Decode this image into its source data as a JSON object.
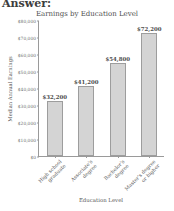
{
  "header": {
    "answer_label": "Answer:"
  },
  "chart_data": {
    "type": "bar",
    "title": "Earnings by Education Level",
    "xlabel": "Education Level",
    "ylabel": "Median Annual Earnings",
    "categories": [
      "High school graduate",
      "Associate's degree",
      "Bachelor's degree",
      "Master's degree or higher"
    ],
    "category_lines": [
      [
        "High school",
        "graduate"
      ],
      [
        "Associate's",
        "degree"
      ],
      [
        "Bachelor's",
        "degree"
      ],
      [
        "Master's degree",
        "or higher"
      ]
    ],
    "values": [
      32200,
      41200,
      54800,
      72200
    ],
    "value_labels": [
      "$32,200",
      "$41,200",
      "$54,800",
      "$72,200"
    ],
    "ylim": [
      0,
      80000
    ],
    "ytick_values": [
      0,
      10000,
      20000,
      30000,
      40000,
      50000,
      60000,
      70000,
      80000
    ],
    "ytick_labels": [
      "$0",
      "$10,000",
      "$20,000",
      "$30,000",
      "$40,000",
      "$50,000",
      "$60,000",
      "$70,000",
      "$80,000"
    ],
    "grid": false,
    "legend": false,
    "bar_color": "#d4d4d4",
    "bar_edge_color": "#9d9d9d",
    "axis_color": "#9a9a9a",
    "text_color": "#4a4a4a"
  }
}
